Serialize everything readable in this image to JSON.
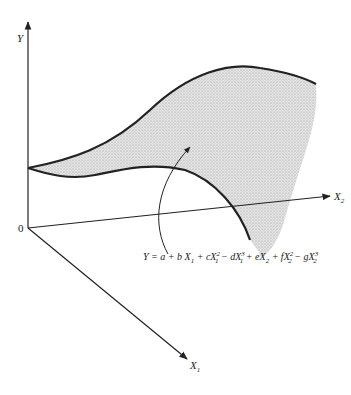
{
  "diagram": {
    "axes": {
      "y_label": "Y",
      "x1_label": "X",
      "x1_sub": "1",
      "x2_label": "X",
      "x2_sub": "2",
      "origin_label": "0"
    },
    "equation": {
      "lhs": "Y = a + b X",
      "parts": [
        {
          "text": "Y = a + b X",
          "sub": "1",
          "sup": ""
        },
        {
          "text": " + cX",
          "sub": "1",
          "sup": "2"
        },
        {
          "text": " − dX",
          "sub": "1",
          "sup": "3"
        },
        {
          "text": " + eX",
          "sub": "2",
          "sup": ""
        },
        {
          "text": " + fX",
          "sub": "2",
          "sup": "2"
        },
        {
          "text": " − gX",
          "sub": "2",
          "sup": "3"
        }
      ]
    },
    "surface_fill": "#c8c8c8",
    "line_color": "#222222"
  }
}
